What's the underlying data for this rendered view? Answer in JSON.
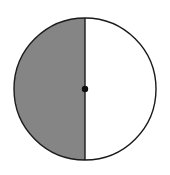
{
  "figure": {
    "background_color": "#ffffff",
    "width": 170,
    "height": 175
  },
  "chart_data": {
    "type": "pie",
    "title": "",
    "subtitle": "",
    "xlabel": "",
    "ylabel": "",
    "legend_position": "none",
    "grid": false,
    "labels": [
      "shaded half",
      "unshaded half"
    ],
    "values": [
      50,
      50
    ],
    "units": "percent",
    "colors": [
      "#858585",
      "#ffffff"
    ],
    "annotations": [
      "center point marked with a filled black dot"
    ]
  },
  "geometry": {
    "circle": {
      "name": "circle",
      "center_x": 85,
      "center_y": 89,
      "radius": 71,
      "stroke_color": "#1a1a1a",
      "stroke_width": 1.4,
      "fill_color": "#ffffff"
    },
    "shaded_region": {
      "name": "left-semicircle",
      "side": "left",
      "fill_color": "#858585",
      "fraction": 0.5
    },
    "unshaded_region": {
      "name": "right-semicircle",
      "side": "right",
      "fill_color": "#ffffff",
      "fraction": 0.5
    },
    "diameter_line": {
      "name": "vertical-diameter",
      "orientation": "vertical",
      "x": 85,
      "y_top": 18,
      "y_bottom": 160,
      "stroke_color": "#1a1a1a",
      "stroke_width": 1.4
    },
    "center_dot": {
      "name": "center-point",
      "cx": 85,
      "cy": 89,
      "radius": 3.2,
      "fill_color": "#0d0d0d"
    }
  }
}
